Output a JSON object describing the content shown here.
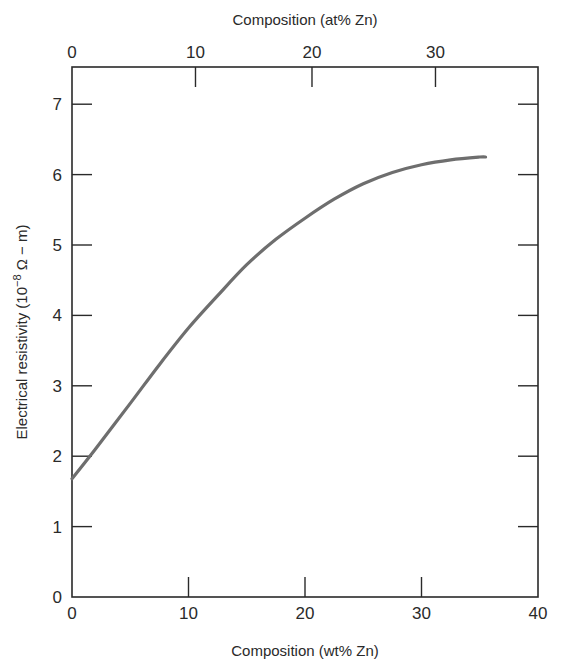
{
  "chart_data": {
    "type": "line",
    "title": "",
    "xlabel": "Composition (wt% Zn)",
    "x2label": "Composition (at% Zn)",
    "ylabel": "Electrical resistivity (10⁻⁸ Ω − m)",
    "xlim": [
      0,
      40
    ],
    "ylim": [
      0,
      7.5
    ],
    "x_ticks": [
      0,
      10,
      20,
      30,
      40
    ],
    "y_ticks": [
      0,
      1,
      2,
      3,
      4,
      5,
      6,
      7
    ],
    "x2_ticks": [
      {
        "label": "0",
        "wt": 0
      },
      {
        "label": "10",
        "wt": 10.6
      },
      {
        "label": "20",
        "wt": 20.6
      },
      {
        "label": "30",
        "wt": 31.2
      }
    ],
    "grid": false,
    "legend": null,
    "series": [
      {
        "name": "Cu-Zn resistivity",
        "color": "#6e6e6e",
        "x": [
          0,
          2,
          5,
          7.5,
          10,
          12.5,
          15,
          17.5,
          20,
          22.5,
          25,
          27.5,
          30,
          32.5,
          35,
          35.5
        ],
        "y": [
          1.68,
          2.1,
          2.75,
          3.3,
          3.82,
          4.28,
          4.72,
          5.08,
          5.38,
          5.65,
          5.87,
          6.03,
          6.14,
          6.21,
          6.25,
          6.25
        ]
      }
    ]
  },
  "labels": {
    "x_bottom_title": "Composition (wt% Zn)",
    "x_top_title": "Composition (at% Zn)",
    "y_title_main": "Electrical resistivity (10",
    "y_title_sup": "−8",
    "y_title_end": " Ω − m)"
  }
}
